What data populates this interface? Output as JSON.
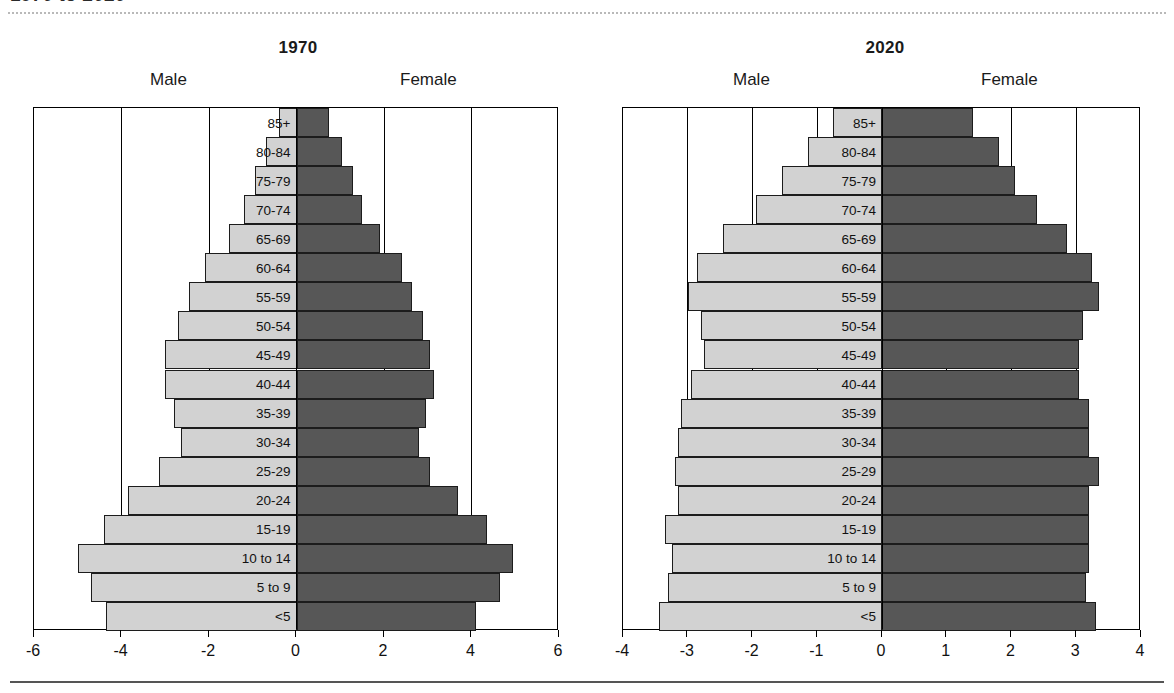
{
  "figure": {
    "clipped_title": "1970 to 2020",
    "male_label": "Male",
    "female_label": "Female"
  },
  "colors": {
    "male_bar": "#d2d2d2",
    "female_bar": "#575757",
    "axis": "#000000",
    "background": "#ffffff"
  },
  "chart_data": [
    {
      "type": "bar",
      "title": "1970",
      "subtype": "population-pyramid",
      "xlabel": "",
      "ylabel": "",
      "xlim": [
        -6,
        6
      ],
      "xticks": [
        -6,
        -4,
        -2,
        0,
        2,
        4,
        6
      ],
      "xticklabels": [
        "-6",
        "-4",
        "-2",
        "0",
        "2",
        "4",
        "6"
      ],
      "grid": true,
      "legend": [
        "Male",
        "Female"
      ],
      "legend_position": "top",
      "categories": [
        "85+",
        "80-84",
        "75-79",
        "70-74",
        "65-69",
        "60-64",
        "55-59",
        "50-54",
        "45-49",
        "40-44",
        "35-39",
        "30-34",
        "25-29",
        "20-24",
        "15-19",
        "10 to 14",
        "5 to 9",
        "<5"
      ],
      "series": [
        {
          "name": "Male",
          "values": [
            -0.4,
            -0.7,
            -0.95,
            -1.2,
            -1.55,
            -2.1,
            -2.45,
            -2.7,
            -3.0,
            -3.0,
            -2.8,
            -2.65,
            -3.15,
            -3.85,
            -4.4,
            -5.0,
            -4.7,
            -4.35
          ]
        },
        {
          "name": "Female",
          "values": [
            0.75,
            1.05,
            1.3,
            1.5,
            1.9,
            2.4,
            2.65,
            2.9,
            3.05,
            3.15,
            2.95,
            2.8,
            3.05,
            3.7,
            4.35,
            4.95,
            4.65,
            4.1
          ]
        }
      ]
    },
    {
      "type": "bar",
      "title": "2020",
      "subtype": "population-pyramid",
      "xlabel": "",
      "ylabel": "",
      "xlim": [
        -4,
        4
      ],
      "xticks": [
        -4,
        -3,
        -2,
        -1,
        0,
        1,
        2,
        3,
        4
      ],
      "xticklabels": [
        "-4",
        "-3",
        "-2",
        "-1",
        "0",
        "1",
        "2",
        "3",
        "4"
      ],
      "grid": true,
      "legend": [
        "Male",
        "Female"
      ],
      "legend_position": "top",
      "categories": [
        "85+",
        "80-84",
        "75-79",
        "70-74",
        "65-69",
        "60-64",
        "55-59",
        "50-54",
        "45-49",
        "40-44",
        "35-39",
        "30-34",
        "25-29",
        "20-24",
        "15-19",
        "10 to 14",
        "5 to 9",
        "<5"
      ],
      "series": [
        {
          "name": "Male",
          "values": [
            -0.75,
            -1.15,
            -1.55,
            -1.95,
            -2.45,
            -2.85,
            -3.0,
            -2.8,
            -2.75,
            -2.95,
            -3.1,
            -3.15,
            -3.2,
            -3.15,
            -3.35,
            -3.25,
            -3.3,
            -3.45
          ]
        },
        {
          "name": "Female",
          "values": [
            1.4,
            1.8,
            2.05,
            2.4,
            2.85,
            3.25,
            3.35,
            3.1,
            3.05,
            3.05,
            3.2,
            3.2,
            3.35,
            3.2,
            3.2,
            3.2,
            3.15,
            3.3
          ]
        }
      ]
    }
  ]
}
